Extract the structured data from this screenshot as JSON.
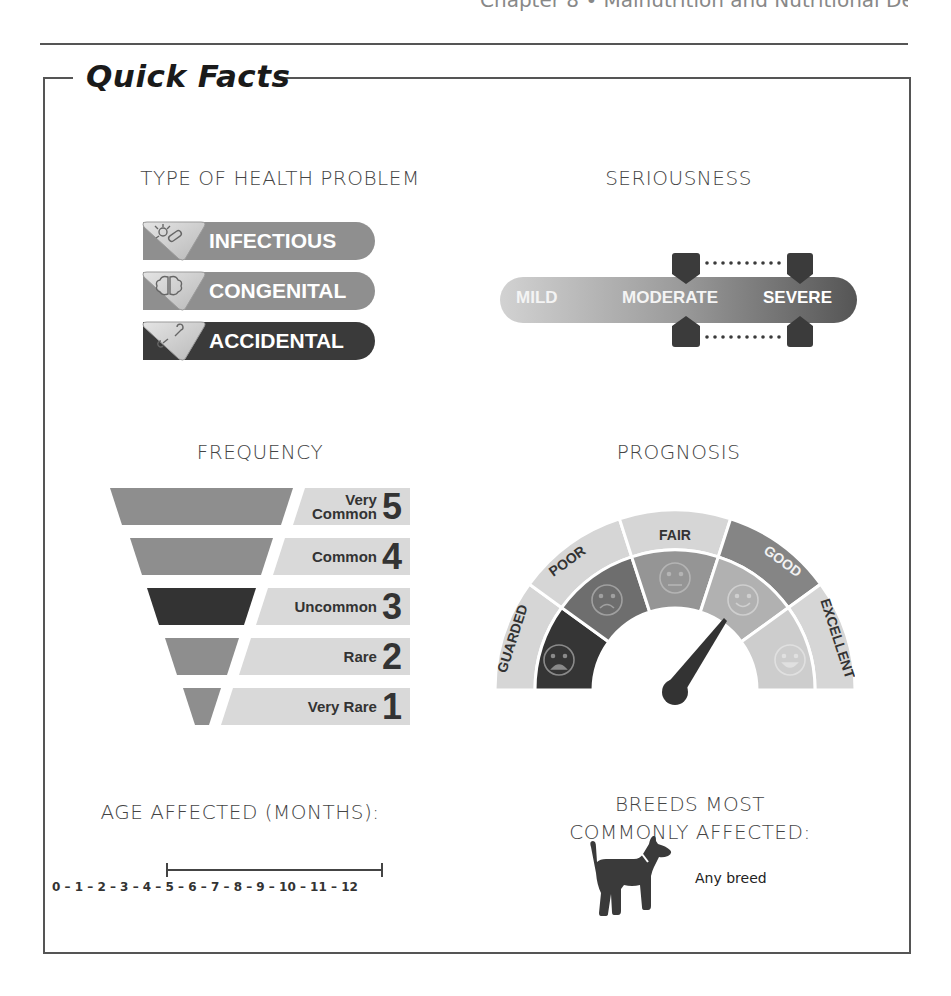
{
  "page": {
    "running_head": "Chapter 8 • Malnutrition and Nutritional Deficiencies",
    "title": "Quick Facts"
  },
  "type_of_health_problem": {
    "heading": "TYPE OF HEALTH PROBLEM",
    "items": [
      {
        "label": "INFECTIOUS",
        "icon": "germ-icon",
        "color": "#8f8f8f"
      },
      {
        "label": "CONGENITAL",
        "icon": "brain-icon",
        "color": "#8f8f8f"
      },
      {
        "label": "ACCIDENTAL",
        "icon": "broken-bone-icon",
        "color": "#3a3a3a",
        "selected": true
      }
    ]
  },
  "seriousness": {
    "heading": "SERIOUSNESS",
    "levels": [
      "MILD",
      "MODERATE",
      "SEVERE"
    ],
    "range_start": "MODERATE",
    "range_end": "SEVERE"
  },
  "frequency": {
    "heading": "FREQUENCY",
    "levels": [
      {
        "label_line1": "Very",
        "label_line2": "Common",
        "number": "5",
        "color": "#8e8e8e"
      },
      {
        "label_line1": "",
        "label_line2": "Common",
        "number": "4",
        "color": "#8e8e8e"
      },
      {
        "label_line1": "",
        "label_line2": "Uncommon",
        "number": "3",
        "color": "#333333",
        "selected": true
      },
      {
        "label_line1": "",
        "label_line2": "Rare",
        "number": "2",
        "color": "#8e8e8e"
      },
      {
        "label_line1": "",
        "label_line2": "Very Rare",
        "number": "1",
        "color": "#8e8e8e"
      }
    ]
  },
  "prognosis": {
    "heading": "PROGNOSIS",
    "levels": [
      {
        "label": "GUARDED",
        "face": "distressed-face-icon"
      },
      {
        "label": "POOR",
        "face": "sad-face-icon"
      },
      {
        "label": "FAIR",
        "face": "neutral-face-icon"
      },
      {
        "label": "GOOD",
        "face": "smile-face-icon",
        "highlighted": true
      },
      {
        "label": "EXCELLENT",
        "face": "happy-face-icon"
      }
    ],
    "needle_points_to": "GOOD"
  },
  "age_affected": {
    "heading": "AGE AFFECTED (MONTHS):",
    "scale": "0 – 1 – 2 – 3 – 4 – 5 – 6 – 7 – 8 – 9 – 10 – 11 – 12",
    "range_start": 3,
    "range_end": 10
  },
  "breeds": {
    "heading_line1": "BREEDS MOST",
    "heading_line2": "COMMONLY AFFECTED:",
    "value": "Any breed"
  }
}
